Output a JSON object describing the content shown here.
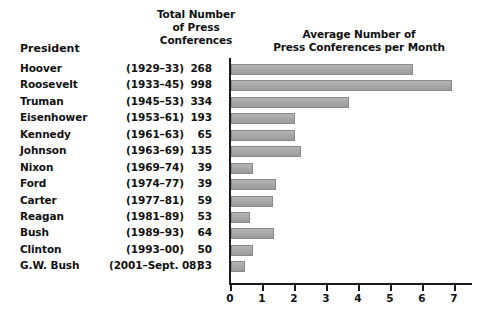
{
  "headers": {
    "president": "President",
    "total_line1": "Total Number",
    "total_line2": "of Press",
    "total_line3": "Conferences",
    "chart_line1": "Average Number of",
    "chart_line2": "Press Conferences per Month"
  },
  "rows": [
    {
      "name": "Hoover",
      "years": "(1929–33)",
      "count": "268"
    },
    {
      "name": "Roosevelt",
      "years": "(1933–45)",
      "count": "998"
    },
    {
      "name": "Truman",
      "years": "(1945–53)",
      "count": "334"
    },
    {
      "name": "Eisenhower",
      "years": "(1953–61)",
      "count": "193"
    },
    {
      "name": "Kennedy",
      "years": "(1961–63)",
      "count": "65"
    },
    {
      "name": "Johnson",
      "years": "(1963–69)",
      "count": "135"
    },
    {
      "name": "Nixon",
      "years": "(1969–74)",
      "count": "39"
    },
    {
      "name": "Ford",
      "years": "(1974–77)",
      "count": "39"
    },
    {
      "name": "Carter",
      "years": "(1977–81)",
      "count": "59"
    },
    {
      "name": "Reagan",
      "years": "(1981–89)",
      "count": "53"
    },
    {
      "name": "Bush",
      "years": "(1989–93)",
      "count": "64"
    },
    {
      "name": "Clinton",
      "years": "(1993–00)",
      "count": "50"
    },
    {
      "name": "G.W. Bush",
      "years": "(2001–Sept. 08)",
      "count": "33"
    }
  ],
  "axis": {
    "ticks": [
      "0",
      "1",
      "2",
      "3",
      "4",
      "5",
      "6",
      "7"
    ]
  },
  "colors": {
    "bar_fill": "#a8a8a8",
    "bar_stroke": "#8a8a8a",
    "axis": "#1a1a1a",
    "text": "#111111",
    "background": "#ffffff"
  },
  "chart_data": {
    "type": "bar",
    "orientation": "horizontal",
    "title": "Average Number of Press Conferences per Month",
    "xlabel": "",
    "ylabel": "",
    "xlim": [
      0,
      7.6
    ],
    "grid": false,
    "legend": null,
    "categories": [
      "Hoover",
      "Roosevelt",
      "Truman",
      "Eisenhower",
      "Kennedy",
      "Johnson",
      "Nixon",
      "Ford",
      "Carter",
      "Reagan",
      "Bush",
      "Clinton",
      "G.W. Bush"
    ],
    "values": [
      5.7,
      6.9,
      3.7,
      2.0,
      2.0,
      2.2,
      0.7,
      1.4,
      1.3,
      0.6,
      1.35,
      0.7,
      0.45
    ],
    "xticks": [
      0,
      1,
      2,
      3,
      4,
      5,
      6,
      7
    ],
    "table_columns": [
      "President",
      "Years",
      "Total Number of Press Conferences"
    ],
    "total_press_conferences": [
      268,
      998,
      334,
      193,
      65,
      135,
      39,
      39,
      59,
      53,
      64,
      50,
      33
    ],
    "terms": [
      "(1929–33)",
      "(1933–45)",
      "(1945–53)",
      "(1953–61)",
      "(1961–63)",
      "(1963–69)",
      "(1969–74)",
      "(1974–77)",
      "(1977–81)",
      "(1981–89)",
      "(1989–93)",
      "(1993–00)",
      "(2001–Sept. 08)"
    ]
  }
}
